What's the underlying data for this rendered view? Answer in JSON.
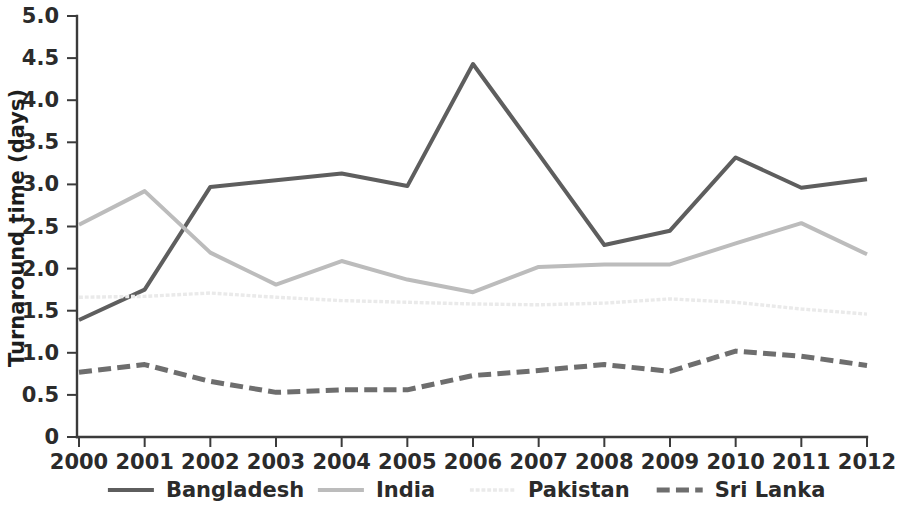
{
  "chart_data": {
    "type": "line",
    "title": "",
    "xlabel": "",
    "ylabel": "Turnaround time (days)",
    "x": [
      2000,
      2001,
      2002,
      2003,
      2004,
      2005,
      2006,
      2007,
      2008,
      2009,
      2010,
      2011,
      2012
    ],
    "categories": [
      "2000",
      "2001",
      "2002",
      "2003",
      "2004",
      "2005",
      "2006",
      "2007",
      "2008",
      "2009",
      "2010",
      "2011",
      "2012"
    ],
    "xlim": [
      2000,
      2012
    ],
    "ylim": [
      0,
      5.0
    ],
    "ytick_labels": [
      "0",
      "0.5",
      "1.0",
      "1.5",
      "2.0",
      "2.5",
      "3.0",
      "3.5",
      "4.0",
      "4.5",
      "5.0"
    ],
    "ytick_values": [
      0,
      0.5,
      1.0,
      1.5,
      2.0,
      2.5,
      3.0,
      3.5,
      4.0,
      4.5,
      5.0
    ],
    "grid": false,
    "legend_position": "bottom",
    "series": [
      {
        "name": "Bangladesh",
        "color": "#5e5e5e",
        "style": "solid",
        "width": 4.0,
        "values": [
          1.39,
          1.75,
          2.97,
          3.05,
          3.13,
          2.98,
          4.43,
          3.36,
          2.28,
          2.45,
          3.32,
          2.96,
          3.06
        ]
      },
      {
        "name": "India",
        "color": "#bcbcbc",
        "style": "solid",
        "width": 4.0,
        "values": [
          2.52,
          2.92,
          2.19,
          1.81,
          2.09,
          1.87,
          1.72,
          2.02,
          2.05,
          2.05,
          2.3,
          2.54,
          2.17
        ]
      },
      {
        "name": "Pakistan",
        "color": "#eaeaea",
        "style": "dotted",
        "width": 3.4,
        "values": [
          1.66,
          1.67,
          1.71,
          1.66,
          1.62,
          1.6,
          1.58,
          1.57,
          1.59,
          1.64,
          1.6,
          1.52,
          1.46
        ]
      },
      {
        "name": "Sri Lanka",
        "color": "#6e6e6e",
        "style": "dashed",
        "width": 5.0,
        "values": [
          0.77,
          0.86,
          0.66,
          0.53,
          0.56,
          0.56,
          0.73,
          0.79,
          0.86,
          0.78,
          1.02,
          0.96,
          0.85
        ]
      }
    ]
  },
  "legend": {
    "items": [
      {
        "label": "Bangladesh",
        "color": "#5e5e5e",
        "style": "solid"
      },
      {
        "label": "India",
        "color": "#bcbcbc",
        "style": "solid"
      },
      {
        "label": "Pakistan",
        "color": "#eaeaea",
        "style": "dotted"
      },
      {
        "label": "Sri Lanka",
        "color": "#6e6e6e",
        "style": "dashed"
      }
    ]
  }
}
